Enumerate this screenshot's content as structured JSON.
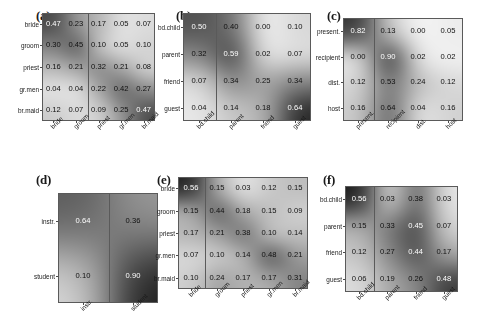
{
  "figure": {
    "background": "#ffffff",
    "colormap": "grayscale-inverted",
    "value_format": "0.00",
    "note": "Six grayscale confusion-matrix heatmaps with numeric cell annotations"
  },
  "chart_data": [
    {
      "type": "heatmap",
      "panel": "a",
      "title": "(a)",
      "row_labels": [
        "bride",
        "groom",
        "priest",
        "gr.men",
        "br.maid"
      ],
      "col_labels": [
        "bride",
        "groom",
        "priest",
        "gr.men",
        "br.maid"
      ],
      "values": [
        [
          0.47,
          0.23,
          0.17,
          0.05,
          0.07
        ],
        [
          0.3,
          0.45,
          0.1,
          0.05,
          0.1
        ],
        [
          0.16,
          0.21,
          0.32,
          0.21,
          0.08
        ],
        [
          0.04,
          0.04,
          0.22,
          0.42,
          0.27
        ],
        [
          0.12,
          0.07,
          0.09,
          0.25,
          0.47
        ]
      ],
      "vmin": 0.0,
      "vmax": 0.62,
      "grid": false,
      "legend": "none",
      "xlabel": "",
      "ylabel": ""
    },
    {
      "type": "heatmap",
      "panel": "b",
      "title": "(b)",
      "row_labels": [
        "bd.child",
        "parent",
        "friend",
        "guest"
      ],
      "col_labels": [
        "bd.child",
        "parent",
        "friend",
        "guest"
      ],
      "values": [
        [
          0.5,
          0.4,
          0.0,
          0.1
        ],
        [
          0.32,
          0.59,
          0.02,
          0.07
        ],
        [
          0.07,
          0.34,
          0.25,
          0.34
        ],
        [
          0.04,
          0.14,
          0.18,
          0.64
        ]
      ],
      "vmin": 0.0,
      "vmax": 0.7,
      "grid": false,
      "legend": "none",
      "xlabel": "",
      "ylabel": ""
    },
    {
      "type": "heatmap",
      "panel": "c",
      "title": "(c)",
      "row_labels": [
        "present.",
        "recipient",
        "dist.",
        "host"
      ],
      "col_labels": [
        "present.",
        "recipient",
        "dist.",
        "host"
      ],
      "values": [
        [
          0.82,
          0.13,
          0.0,
          0.05
        ],
        [
          0.0,
          0.9,
          0.02,
          0.02
        ],
        [
          0.12,
          0.53,
          0.24,
          0.12
        ],
        [
          0.16,
          0.64,
          0.04,
          0.16
        ]
      ],
      "vmin": 0.0,
      "vmax": 0.95,
      "grid": false,
      "legend": "none",
      "xlabel": "",
      "ylabel": ""
    },
    {
      "type": "heatmap",
      "panel": "d",
      "title": "(d)",
      "row_labels": [
        "instr.",
        "student"
      ],
      "col_labels": [
        "instr.",
        "student"
      ],
      "values": [
        [
          0.64,
          0.36
        ],
        [
          0.1,
          0.9
        ]
      ],
      "vmin": 0.0,
      "vmax": 0.95,
      "grid": false,
      "legend": "none",
      "xlabel": "",
      "ylabel": ""
    },
    {
      "type": "heatmap",
      "panel": "e",
      "title": "(e)",
      "row_labels": [
        "bride",
        "groom",
        "priest",
        "gr.men",
        "br.maid"
      ],
      "col_labels": [
        "bride",
        "groom",
        "priest",
        "gr.men",
        "br.maid"
      ],
      "values": [
        [
          0.56,
          0.15,
          0.03,
          0.12,
          0.15
        ],
        [
          0.15,
          0.44,
          0.18,
          0.15,
          0.09
        ],
        [
          0.17,
          0.21,
          0.38,
          0.1,
          0.14
        ],
        [
          0.07,
          0.1,
          0.14,
          0.48,
          0.21
        ],
        [
          0.1,
          0.24,
          0.17,
          0.17,
          0.31
        ]
      ],
      "vmin": 0.0,
      "vmax": 0.6,
      "grid": false,
      "legend": "none",
      "xlabel": "",
      "ylabel": ""
    },
    {
      "type": "heatmap",
      "panel": "f",
      "title": "(f)",
      "row_labels": [
        "bd.child",
        "parent",
        "friend",
        "guest"
      ],
      "col_labels": [
        "bd.child",
        "parent",
        "friend",
        "guest"
      ],
      "values": [
        [
          0.56,
          0.03,
          0.38,
          0.03
        ],
        [
          0.15,
          0.33,
          0.45,
          0.07
        ],
        [
          0.12,
          0.27,
          0.44,
          0.17
        ],
        [
          0.06,
          0.19,
          0.26,
          0.48
        ]
      ],
      "vmin": 0.0,
      "vmax": 0.58,
      "grid": false,
      "legend": "none",
      "xlabel": "",
      "ylabel": ""
    }
  ],
  "layout": {
    "panels": [
      {
        "id": "a",
        "label_x": 36,
        "label_y": 8,
        "grid_x": 42,
        "grid_y": 13,
        "grid_w": 113,
        "grid_h": 108,
        "sep_after_col": 2
      },
      {
        "id": "b",
        "label_x": 176,
        "label_y": 8,
        "grid_x": 183,
        "grid_y": 13,
        "grid_w": 128,
        "grid_h": 108,
        "sep_after_col": 1
      },
      {
        "id": "c",
        "label_x": 327,
        "label_y": 8,
        "grid_x": 343,
        "grid_y": 18,
        "grid_w": 120,
        "grid_h": 103,
        "sep_after_col": 1
      },
      {
        "id": "d",
        "label_x": 36,
        "label_y": 172,
        "grid_x": 58,
        "grid_y": 193,
        "grid_w": 100,
        "grid_h": 110,
        "sep_after_col": 1
      },
      {
        "id": "e",
        "label_x": 157,
        "label_y": 172,
        "grid_x": 178,
        "grid_y": 177,
        "grid_w": 130,
        "grid_h": 112,
        "sep_after_col": 1
      },
      {
        "id": "f",
        "label_x": 323,
        "label_y": 172,
        "grid_x": 345,
        "grid_y": 186,
        "grid_w": 113,
        "grid_h": 106,
        "sep_after_col": 1
      }
    ]
  }
}
